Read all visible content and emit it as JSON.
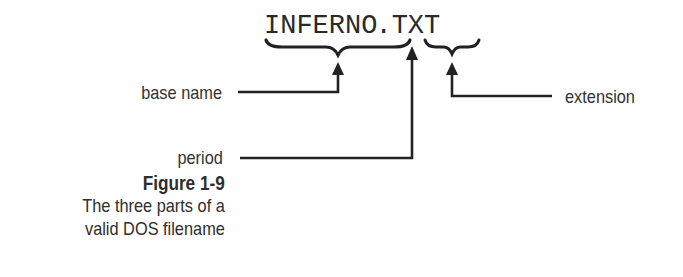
{
  "filename": {
    "base": "INFERNO",
    "period": ".",
    "extension": "TXT"
  },
  "labels": {
    "base_name": "base name",
    "period": "period",
    "extension": "extension"
  },
  "caption": {
    "title": "Figure 1-9",
    "line1": "The three parts of a",
    "line2": "valid DOS filename"
  },
  "colors": {
    "ink": "#222222",
    "background": "#ffffff"
  }
}
